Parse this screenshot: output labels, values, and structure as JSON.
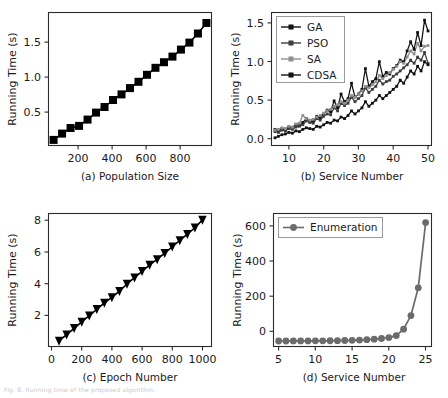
{
  "figure": {
    "background": "#ffffff",
    "footnote": "Fig. 8. Running time of the proposed algorithm."
  },
  "chart_data": [
    {
      "id": "panel_a",
      "type": "line",
      "title": "",
      "caption": "(a) Population Size",
      "xlabel": "(a) Population Size",
      "ylabel": "Running Time (s)",
      "marker": "square",
      "color": "#000000",
      "xlim": [
        20,
        980
      ],
      "ylim": [
        0.05,
        1.95
      ],
      "xticks": [
        200,
        400,
        600,
        800
      ],
      "yticks": [
        0.5,
        1.0,
        1.5
      ],
      "ytick_labels": [
        "0.5",
        "1.0",
        "1.5"
      ],
      "xtick_labels": [
        "200",
        "400",
        "600",
        "800"
      ],
      "grid": false,
      "legend": null,
      "series": [
        {
          "name": "Running Time",
          "x": [
            50,
            100,
            150,
            200,
            250,
            300,
            350,
            400,
            450,
            500,
            550,
            600,
            650,
            700,
            750,
            800,
            850,
            900,
            950
          ],
          "values": [
            0.13,
            0.22,
            0.3,
            0.33,
            0.42,
            0.52,
            0.6,
            0.7,
            0.78,
            0.87,
            0.96,
            1.06,
            1.16,
            1.24,
            1.32,
            1.42,
            1.52,
            1.65,
            1.8
          ]
        }
      ]
    },
    {
      "id": "panel_b",
      "type": "line",
      "title": "",
      "caption": "(b) Service Number",
      "xlabel": "(b) Service Number",
      "ylabel": "Running Time (s)",
      "xlim": [
        5,
        51
      ],
      "ylim": [
        -0.05,
        1.68
      ],
      "xticks": [
        10,
        20,
        30,
        40,
        50
      ],
      "yticks": [
        0.0,
        0.5,
        1.0,
        1.5
      ],
      "xtick_labels": [
        "10",
        "20",
        "30",
        "40",
        "50"
      ],
      "ytick_labels": [
        "0.0",
        "0.5",
        "1.0",
        "1.5"
      ],
      "grid": false,
      "legend_position": "upper left",
      "legend": [
        "GA",
        "PSO",
        "SA",
        "CDSA"
      ],
      "legend_colors": [
        "#111111",
        "#3d3d3d",
        "#8f8f8f",
        "#111111"
      ],
      "x": [
        6,
        7,
        8,
        9,
        10,
        11,
        12,
        13,
        14,
        15,
        16,
        17,
        18,
        19,
        20,
        21,
        22,
        23,
        24,
        25,
        26,
        27,
        28,
        29,
        30,
        31,
        32,
        33,
        34,
        35,
        36,
        37,
        38,
        39,
        40,
        41,
        42,
        43,
        44,
        45,
        46,
        47,
        48,
        49,
        50
      ],
      "series": [
        {
          "name": "GA",
          "color": "#111111",
          "values": [
            0.16,
            0.14,
            0.17,
            0.15,
            0.19,
            0.18,
            0.22,
            0.21,
            0.25,
            0.3,
            0.27,
            0.26,
            0.33,
            0.31,
            0.36,
            0.41,
            0.39,
            0.53,
            0.44,
            0.62,
            0.52,
            0.56,
            0.76,
            0.58,
            0.62,
            0.68,
            0.95,
            0.72,
            0.78,
            0.82,
            1.04,
            0.85,
            0.9,
            0.88,
            0.95,
            0.99,
            1.06,
            1.04,
            1.18,
            1.3,
            1.2,
            1.42,
            1.25,
            1.58,
            1.44
          ]
        },
        {
          "name": "PSO",
          "color": "#3d3d3d",
          "values": [
            0.13,
            0.12,
            0.15,
            0.14,
            0.17,
            0.16,
            0.19,
            0.2,
            0.22,
            0.27,
            0.25,
            0.24,
            0.3,
            0.28,
            0.33,
            0.36,
            0.35,
            0.44,
            0.4,
            0.5,
            0.47,
            0.5,
            0.58,
            0.52,
            0.56,
            0.6,
            0.7,
            0.64,
            0.68,
            0.72,
            0.8,
            0.75,
            0.78,
            0.8,
            0.85,
            0.88,
            0.92,
            0.96,
            1.0,
            1.06,
            1.02,
            1.1,
            1.06,
            1.16,
            1.02
          ]
        },
        {
          "name": "SA",
          "color": "#8f8f8f",
          "values": [
            0.15,
            0.16,
            0.18,
            0.17,
            0.2,
            0.19,
            0.23,
            0.24,
            0.34,
            0.3,
            0.28,
            0.29,
            0.32,
            0.34,
            0.37,
            0.4,
            0.42,
            0.46,
            0.48,
            0.52,
            0.5,
            0.54,
            0.6,
            0.58,
            0.62,
            0.66,
            0.72,
            0.7,
            0.74,
            0.78,
            0.86,
            0.82,
            0.86,
            0.9,
            0.94,
            0.98,
            1.04,
            1.02,
            1.1,
            1.18,
            1.14,
            1.28,
            1.18,
            1.24,
            1.25
          ]
        },
        {
          "name": "CDSA",
          "color": "#111111",
          "values": [
            0.05,
            0.07,
            0.09,
            0.1,
            0.12,
            0.11,
            0.14,
            0.13,
            0.16,
            0.18,
            0.17,
            0.16,
            0.2,
            0.19,
            0.22,
            0.25,
            0.24,
            0.28,
            0.27,
            0.32,
            0.3,
            0.34,
            0.4,
            0.36,
            0.4,
            0.44,
            0.52,
            0.46,
            0.5,
            0.54,
            0.6,
            0.56,
            0.6,
            0.64,
            0.68,
            0.72,
            0.8,
            0.76,
            0.84,
            0.92,
            0.88,
            0.98,
            0.92,
            1.04,
            1.0
          ]
        }
      ]
    },
    {
      "id": "panel_c",
      "type": "line",
      "title": "",
      "caption": "(c) Epoch Number",
      "xlabel": "(c) Epoch Number",
      "ylabel": "Running Time (s)",
      "marker": "triangle-down",
      "color": "#000000",
      "xlim": [
        -20,
        1060
      ],
      "ylim": [
        0.1,
        8.5
      ],
      "xticks": [
        0,
        200,
        400,
        600,
        800,
        1000
      ],
      "yticks": [
        2,
        4,
        6,
        8
      ],
      "xtick_labels": [
        "0",
        "200",
        "400",
        "600",
        "800",
        "1000"
      ],
      "ytick_labels": [
        "2",
        "4",
        "6",
        "8"
      ],
      "grid": false,
      "legend": null,
      "series": [
        {
          "name": "Running Time",
          "x": [
            50,
            100,
            150,
            200,
            250,
            300,
            350,
            400,
            450,
            500,
            550,
            600,
            650,
            700,
            750,
            800,
            850,
            900,
            950,
            1000
          ],
          "values": [
            0.45,
            0.85,
            1.25,
            1.65,
            2.05,
            2.45,
            2.85,
            3.2,
            3.6,
            4.05,
            4.45,
            4.85,
            5.25,
            5.6,
            6.0,
            6.4,
            6.8,
            7.2,
            7.6,
            8.1
          ]
        }
      ]
    },
    {
      "id": "panel_d",
      "type": "line",
      "title": "",
      "caption": "(d) Service Number",
      "xlabel": "(d) Service Number",
      "ylabel": "Running Time (s)",
      "marker": "circle",
      "color": "#6b6b6b",
      "xlim": [
        4.3,
        25.8
      ],
      "ylim": [
        -30,
        700
      ],
      "xticks": [
        5,
        10,
        15,
        20,
        25
      ],
      "yticks": [
        0,
        200,
        400,
        600
      ],
      "xtick_labels": [
        "5",
        "10",
        "15",
        "20",
        "25"
      ],
      "ytick_labels": [
        "0",
        "200",
        "400",
        "600"
      ],
      "grid": false,
      "legend_position": "upper left",
      "legend": [
        "Enumeration"
      ],
      "series": [
        {
          "name": "Enumeration",
          "color": "#6b6b6b",
          "x": [
            5,
            6,
            7,
            8,
            9,
            10,
            11,
            12,
            13,
            14,
            15,
            16,
            17,
            18,
            19,
            20,
            21,
            22,
            23,
            24,
            25
          ],
          "values": [
            0.2,
            0.3,
            0.4,
            0.5,
            0.7,
            0.9,
            1.2,
            1.6,
            2.2,
            3.0,
            4.0,
            5.5,
            7.5,
            10,
            14,
            19,
            30,
            65,
            140,
            292,
            650
          ]
        }
      ]
    }
  ]
}
